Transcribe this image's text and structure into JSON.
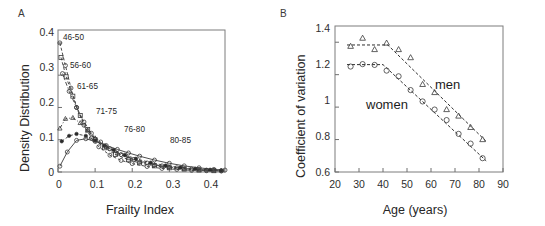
{
  "figure": {
    "width": 545,
    "height": 226,
    "background": "#ffffff"
  },
  "panel_a": {
    "letter": "A",
    "xlabel": "Frailty Index",
    "ylabel": "Density Distribution",
    "yticks": [
      "0",
      "0.1",
      "0.2",
      "0.3",
      "0.4"
    ],
    "xticks": [
      "0",
      "0.1",
      "0.2",
      "0.3",
      "0.4"
    ],
    "series_labels": [
      {
        "text": "46-50",
        "x": 0.012,
        "y": 0.385
      },
      {
        "text": "56-60",
        "x": 0.028,
        "y": 0.305
      },
      {
        "text": "61-65",
        "x": 0.042,
        "y": 0.245
      },
      {
        "text": "71-75",
        "x": 0.085,
        "y": 0.175
      },
      {
        "text": "76-80",
        "x": 0.158,
        "y": 0.128
      },
      {
        "text": "80-85",
        "x": 0.245,
        "y": 0.105
      }
    ]
  },
  "panel_b": {
    "letter": "B",
    "xlabel": "Age (years)",
    "ylabel": "Coefficient of variation",
    "yticks": [
      "0.6",
      "0.8",
      "1",
      "1.2",
      "1.4"
    ],
    "xticks": [
      "20",
      "30",
      "40",
      "50",
      "60",
      "70",
      "80",
      "90"
    ],
    "annotations": [
      {
        "text": "men",
        "x": 63,
        "y": 1.16
      },
      {
        "text": "women",
        "x": 40,
        "y": 1.06
      }
    ]
  },
  "chart_data": [
    {
      "type": "line",
      "panel": "A",
      "title": "",
      "xlabel": "Frailty Index",
      "ylabel": "Density Distribution",
      "xlim": [
        0,
        0.45
      ],
      "ylim": [
        0,
        0.44
      ],
      "xticks": [
        0,
        0.1,
        0.2,
        0.3,
        0.4
      ],
      "yticks": [
        0,
        0.1,
        0.2,
        0.3,
        0.4
      ],
      "grid": false,
      "legend": "inline-labels",
      "series": [
        {
          "name": "46-50",
          "marker": "open-circle",
          "linestyle": "dashed",
          "x": [
            0.005,
            0.02,
            0.035,
            0.05,
            0.07,
            0.09,
            0.11,
            0.14,
            0.17,
            0.2,
            0.24,
            0.28,
            0.32,
            0.36,
            0.4,
            0.44
          ],
          "y": [
            0.4,
            0.33,
            0.26,
            0.2,
            0.145,
            0.105,
            0.078,
            0.052,
            0.036,
            0.026,
            0.017,
            0.011,
            0.008,
            0.005,
            0.004,
            0.003
          ]
        },
        {
          "name": "56-60",
          "marker": "open-square",
          "linestyle": "dashed",
          "x": [
            0.008,
            0.022,
            0.04,
            0.06,
            0.08,
            0.1,
            0.125,
            0.155,
            0.19,
            0.22,
            0.26,
            0.3,
            0.34,
            0.38,
            0.42
          ],
          "y": [
            0.355,
            0.295,
            0.235,
            0.175,
            0.132,
            0.1,
            0.075,
            0.054,
            0.038,
            0.028,
            0.019,
            0.013,
            0.009,
            0.006,
            0.004
          ]
        },
        {
          "name": "61-65",
          "marker": "open-circle",
          "linestyle": "dash-dot",
          "x": [
            0.012,
            0.03,
            0.05,
            0.07,
            0.09,
            0.115,
            0.14,
            0.17,
            0.205,
            0.24,
            0.28,
            0.32,
            0.36,
            0.4,
            0.44
          ],
          "y": [
            0.305,
            0.25,
            0.2,
            0.155,
            0.12,
            0.093,
            0.072,
            0.054,
            0.039,
            0.028,
            0.019,
            0.013,
            0.009,
            0.006,
            0.004
          ]
        },
        {
          "name": "71-75",
          "marker": "open-triangle",
          "linestyle": "dash-dot",
          "x": [
            0.005,
            0.02,
            0.04,
            0.06,
            0.08,
            0.1,
            0.13,
            0.16,
            0.19,
            0.22,
            0.26,
            0.3,
            0.34,
            0.38,
            0.42
          ],
          "y": [
            0.135,
            0.165,
            0.168,
            0.152,
            0.128,
            0.105,
            0.078,
            0.058,
            0.043,
            0.032,
            0.022,
            0.015,
            0.01,
            0.007,
            0.005
          ]
        },
        {
          "name": "76-80",
          "marker": "filled-circle",
          "linestyle": "dashed",
          "x": [
            0.01,
            0.03,
            0.05,
            0.075,
            0.1,
            0.125,
            0.15,
            0.18,
            0.21,
            0.25,
            0.29,
            0.33,
            0.37,
            0.41,
            0.44
          ],
          "y": [
            0.095,
            0.112,
            0.118,
            0.112,
            0.098,
            0.082,
            0.068,
            0.053,
            0.041,
            0.029,
            0.02,
            0.014,
            0.01,
            0.007,
            0.005
          ]
        },
        {
          "name": "80-85",
          "marker": "open-circle",
          "linestyle": "solid",
          "x": [
            0.005,
            0.025,
            0.05,
            0.075,
            0.1,
            0.13,
            0.16,
            0.19,
            0.22,
            0.26,
            0.3,
            0.34,
            0.38,
            0.42,
            0.45
          ],
          "y": [
            0.018,
            0.062,
            0.098,
            0.103,
            0.095,
            0.082,
            0.07,
            0.059,
            0.049,
            0.037,
            0.027,
            0.019,
            0.013,
            0.008,
            0.006
          ]
        }
      ]
    },
    {
      "type": "scatter",
      "panel": "B",
      "title": "",
      "xlabel": "Age (years)",
      "ylabel": "Coefficient of variation",
      "xlim": [
        20,
        90
      ],
      "ylim": [
        0.6,
        1.5
      ],
      "xticks": [
        20,
        30,
        40,
        50,
        60,
        70,
        80,
        90
      ],
      "yticks": [
        0.6,
        0.8,
        1.0,
        1.2,
        1.4
      ],
      "grid": false,
      "legend": "inline-annotations",
      "series": [
        {
          "name": "men",
          "marker": "open-triangle",
          "linestyle": "dashed",
          "x": [
            26.5,
            31.5,
            36.5,
            41.5,
            46.5,
            51.5,
            56.5,
            61.5,
            66.5,
            71.5,
            76.5,
            81.5
          ],
          "y": [
            1.375,
            1.425,
            1.355,
            1.395,
            1.355,
            1.305,
            1.14,
            1.09,
            0.985,
            0.945,
            0.875,
            0.8
          ],
          "fit": {
            "type": "segmented",
            "breakpoint": 42,
            "plateau": 1.383,
            "slope_after": -0.0145
          }
        },
        {
          "name": "women",
          "marker": "open-circle",
          "linestyle": "dashed",
          "x": [
            26.5,
            31.5,
            36.5,
            41.5,
            46.5,
            51.5,
            56.5,
            61.5,
            66.5,
            71.5,
            76.5,
            81.5
          ],
          "y": [
            1.25,
            1.265,
            1.26,
            1.225,
            1.19,
            1.105,
            1.035,
            0.985,
            0.92,
            0.835,
            0.775,
            0.685
          ],
          "fit": {
            "type": "segmented",
            "breakpoint": 40,
            "plateau": 1.262,
            "slope_after": -0.0138
          }
        }
      ]
    }
  ]
}
